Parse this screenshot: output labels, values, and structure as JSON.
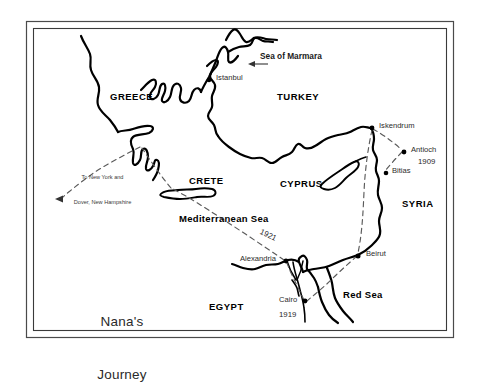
{
  "figure": {
    "title_line1": "Nana's",
    "title_line2": "Journey",
    "frame_color": "#3a3a3a",
    "background_color": "#ffffff",
    "coastline_color": "#000000",
    "route_color": "#555555"
  },
  "countries": [
    {
      "name": "GREECE",
      "label": "GREECE",
      "x": 110,
      "y": 92
    },
    {
      "name": "TURKEY",
      "label": "TURKEY",
      "x": 277,
      "y": 92
    },
    {
      "name": "CRETE",
      "label": "CRETE",
      "x": 189,
      "y": 176
    },
    {
      "name": "CYPRUS",
      "label": "CYPRUS",
      "x": 280,
      "y": 179
    },
    {
      "name": "SYRIA",
      "label": "SYRIA",
      "x": 402,
      "y": 199
    },
    {
      "name": "EGYPT",
      "label": "EGYPT",
      "x": 209,
      "y": 302
    }
  ],
  "seas": [
    {
      "name": "Sea of Marmara",
      "label": "Sea of Marmara",
      "x": 260,
      "y": 57,
      "style": "small"
    },
    {
      "name": "Mediterranean Sea",
      "label": "Mediterranean Sea",
      "x": 179,
      "y": 214,
      "style": "bold"
    },
    {
      "name": "Red Sea",
      "label": "Red Sea",
      "x": 343,
      "y": 290,
      "style": "bold"
    }
  ],
  "cities": [
    {
      "name": "Istanbul",
      "label": "Istanbul",
      "label_x": 216,
      "label_y": 77,
      "dot_x": 209,
      "dot_y": 80
    },
    {
      "name": "Iskendrum",
      "label": "Iskendrum",
      "label_x": 380,
      "label_y": 125,
      "dot_x": 371,
      "dot_y": 128
    },
    {
      "name": "Antioch",
      "label": "Antioch",
      "label_x": 411,
      "label_y": 148,
      "dot_x": 404,
      "dot_y": 151
    },
    {
      "name": "Bitias",
      "label": "Bitias",
      "label_x": 392,
      "label_y": 169,
      "dot_x": 385,
      "dot_y": 172
    },
    {
      "name": "Beirut",
      "label": "Beirut",
      "label_x": 369,
      "label_y": 251,
      "dot_x": 358,
      "dot_y": 255
    },
    {
      "name": "Alexandria",
      "label": "Alexandria",
      "label_x": 242,
      "label_y": 258,
      "dot_x": 285,
      "dot_y": 261
    },
    {
      "name": "Cairo",
      "label": "Cairo",
      "label_x": 280,
      "label_y": 298,
      "dot_x": 305,
      "dot_y": 301
    }
  ],
  "years": [
    {
      "name": "antioch-year",
      "label": "1909",
      "x": 418,
      "y": 160,
      "rotated": false
    },
    {
      "name": "route-year",
      "label": "1921",
      "x": 264,
      "y": 232,
      "rotated": true
    },
    {
      "name": "cairo-year",
      "label": "1919",
      "x": 279,
      "y": 313,
      "rotated": false
    }
  ],
  "annotations": [
    {
      "name": "to-new-york-note",
      "line1": "To New York and",
      "line2": "Dover, New Hampshire",
      "x": 56,
      "y": 159
    }
  ],
  "route": {
    "name": "nana-journey-route",
    "description": "dashed travel route",
    "segments": [
      "Iskendrum to Antioch",
      "Antioch to Bitias",
      "Iskendrum south along Syrian coast to Beirut",
      "Beirut to Cairo",
      "Cairo to Alexandria",
      "Alexandria west across Mediterranean past Crete",
      "Crete northwest to Greece, then west off-map toward New York"
    ]
  },
  "arrows": [
    {
      "name": "marmara-arrow",
      "direction": "left",
      "x": 250,
      "y": 64
    },
    {
      "name": "westward-route-arrow",
      "direction": "left",
      "x": 57,
      "y": 200
    }
  ]
}
